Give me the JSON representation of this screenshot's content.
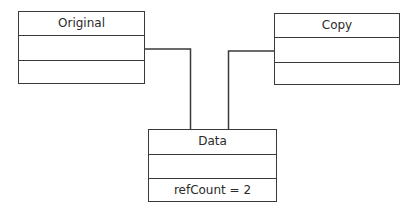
{
  "diagram": {
    "type": "uml-object-diagram",
    "boxes": {
      "original": {
        "title": "Original",
        "attributes": "",
        "operations": ""
      },
      "copy": {
        "title": "Copy",
        "attributes": "",
        "operations": ""
      },
      "data": {
        "title": "Data",
        "attributes": "",
        "operations": "refCount = 2"
      }
    },
    "connections": [
      {
        "from": "original",
        "to": "data"
      },
      {
        "from": "copy",
        "to": "data"
      }
    ],
    "colors": {
      "line": "#3a3a3a",
      "text": "#2a2a2a",
      "background": "#ffffff"
    }
  }
}
